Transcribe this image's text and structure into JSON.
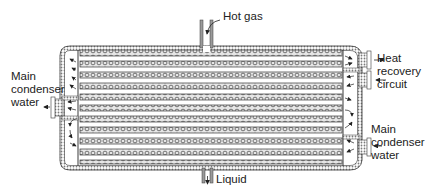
{
  "diagram": {
    "colors": {
      "line": "#3a3a3a",
      "shell_hatch": "#8a8a8a",
      "tube_fill": "#d8d8d8",
      "background": "#ffffff"
    },
    "labels": {
      "hot_gas": "Hot gas",
      "liquid": "Liquid",
      "heat_recovery": [
        "Heat",
        "recovery",
        "circuit"
      ],
      "main_condenser_left": [
        "Main",
        "condenser",
        "water"
      ],
      "main_condenser_right": [
        "Main",
        "condenser",
        "water"
      ]
    },
    "tubes": {
      "count": 10,
      "rows_y": [
        53,
        64,
        75,
        86,
        97,
        108,
        119,
        130,
        141,
        152
      ],
      "x_start": 78,
      "x_end": 343
    }
  }
}
